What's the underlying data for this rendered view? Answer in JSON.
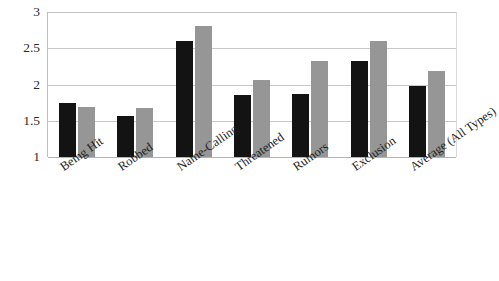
{
  "chart_data": {
    "type": "bar",
    "title": "",
    "xlabel": "",
    "ylabel": "",
    "ylim": [
      1,
      3
    ],
    "yticks": [
      "3",
      "2.5",
      "2",
      "1.5",
      "1"
    ],
    "ytick_values": [
      3,
      2.5,
      2,
      1.5,
      1
    ],
    "grid": true,
    "legend": "none",
    "categories": [
      "Being Hit",
      "Robbed",
      "Name-Calling",
      "Threatened",
      "Rumors",
      "Exclusion",
      "Average (All Types)"
    ],
    "series": [
      {
        "name": "Series 1",
        "color": "#131313",
        "values": [
          1.74,
          1.56,
          2.6,
          1.86,
          1.87,
          2.32,
          1.98
        ]
      },
      {
        "name": "Series 2",
        "color": "#969696",
        "values": [
          1.69,
          1.67,
          2.81,
          2.06,
          2.33,
          2.6,
          2.18
        ]
      }
    ]
  },
  "colors": {
    "series_a": "#131313",
    "series_b": "#969696",
    "gridline": "#c9c9c9",
    "background": "#ffffff",
    "text": "#1f1f1f"
  }
}
